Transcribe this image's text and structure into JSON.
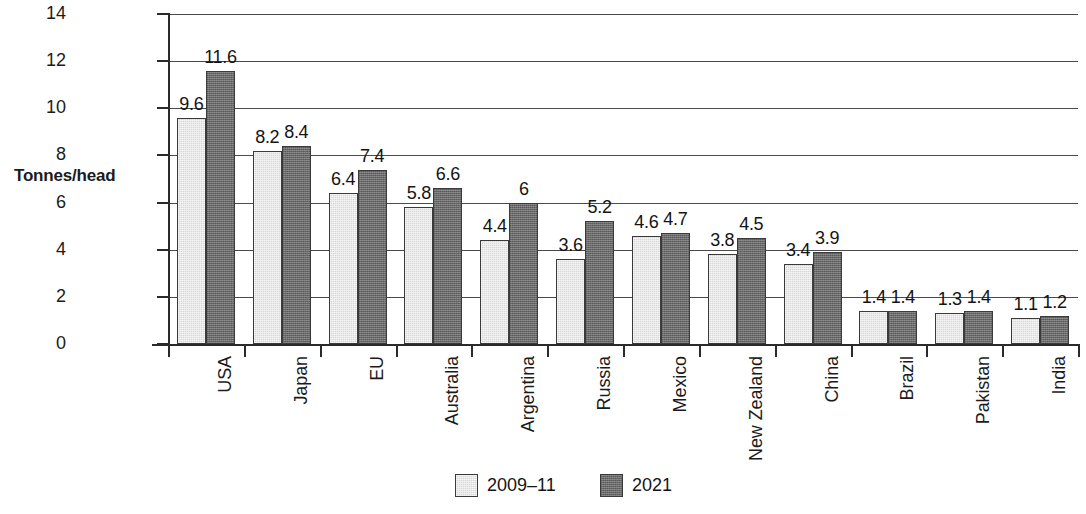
{
  "chart_data": {
    "type": "bar",
    "title": "",
    "xlabel": "",
    "ylabel": "Tonnes/head",
    "ylim": [
      0,
      14
    ],
    "yticks": [
      0,
      2,
      4,
      6,
      8,
      10,
      12,
      14
    ],
    "grid": true,
    "legend_position": "bottom-center",
    "categories": [
      "USA",
      "Japan",
      "EU",
      "Australia",
      "Argentina",
      "Russia",
      "Mexico",
      "New Zealand",
      "China",
      "Brazil",
      "Pakistan",
      "India"
    ],
    "series": [
      {
        "name": "2009–11",
        "color": "#d7d7d7",
        "values": [
          9.6,
          8.2,
          6.4,
          5.8,
          4.4,
          3.6,
          4.6,
          3.8,
          3.4,
          1.4,
          1.3,
          1.1
        ],
        "labels": [
          "9.6",
          "8.2",
          "6.4",
          "5.8",
          "4.4",
          "3.6",
          "4.6",
          "3.8",
          "3.4",
          "1.4",
          "1.3",
          "1.1"
        ]
      },
      {
        "name": "2021",
        "color": "#6b6b6b",
        "values": [
          11.6,
          8.4,
          7.4,
          6.6,
          6,
          5.2,
          4.7,
          4.5,
          3.9,
          1.4,
          1.4,
          1.2
        ],
        "labels": [
          "11.6",
          "8.4",
          "7.4",
          "6.6",
          "6",
          "5.2",
          "4.7",
          "4.5",
          "3.9",
          "1.4",
          "1.4",
          "1.2"
        ]
      }
    ]
  },
  "legend": {
    "entries": [
      {
        "label": "2009–11",
        "swatch": "light-gray"
      },
      {
        "label": "2021",
        "swatch": "dark-gray"
      }
    ]
  }
}
